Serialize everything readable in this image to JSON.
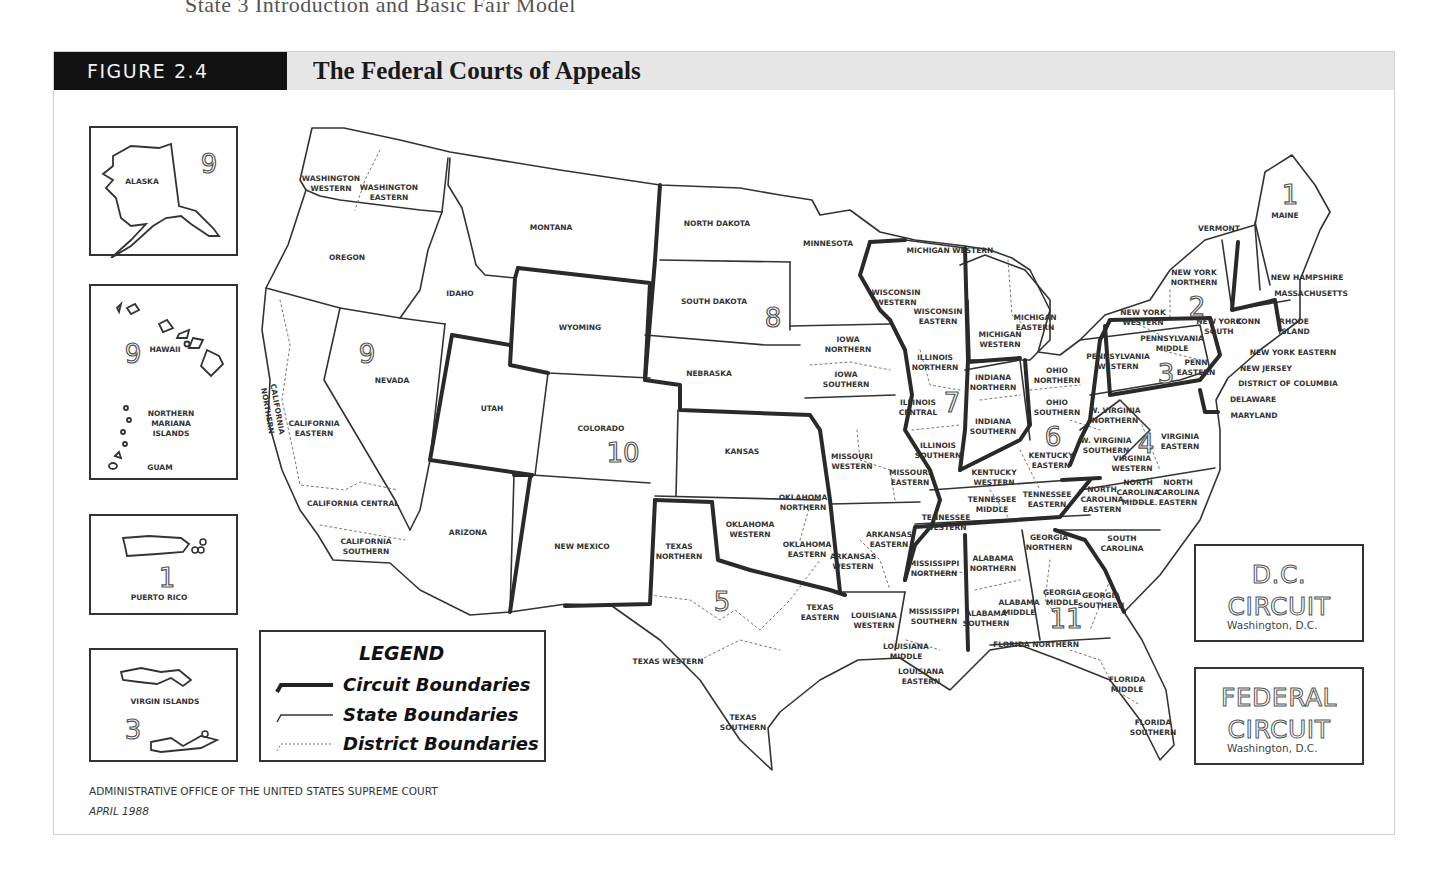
{
  "page_header": "State 3    Introduction and Basic Fair Model",
  "figure": {
    "label": "FIGURE 2.4",
    "title": "The Federal Courts of Appeals",
    "colors": {
      "label_bg": "#111111",
      "header_bg": "#e6e6e6",
      "line": "#333333"
    }
  },
  "insets": {
    "alaska": {
      "label": "ALASKA",
      "circuit": "9"
    },
    "hawaii": {
      "label": "HAWAII",
      "circuit": "9",
      "mariana": "NORTHERN\nMARIANA\nISLANDS",
      "guam": "GUAM"
    },
    "puerto_rico": {
      "label": "PUERTO RICO",
      "circuit": "1"
    },
    "virgin_islands": {
      "label": "VIRGIN ISLANDS",
      "circuit": "3"
    }
  },
  "legend": {
    "title": "LEGEND",
    "items": [
      {
        "style": "circuit",
        "label": "Circuit Boundaries"
      },
      {
        "style": "state",
        "label": "State Boundaries"
      },
      {
        "style": "district",
        "label": "District Boundaries"
      }
    ]
  },
  "special_circuits": [
    {
      "line1": "D.C.",
      "line2": "CIRCUIT",
      "location": "Washington, D.C."
    },
    {
      "line1": "FEDERAL",
      "line2": "CIRCUIT",
      "location": "Washington, D.C."
    }
  ],
  "credit": {
    "source": "ADMINISTRATIVE OFFICE OF THE UNITED STATES SUPREME COURT",
    "date": "APRIL 1988"
  },
  "circuit_numbers": [
    {
      "n": "1",
      "x": 1290,
      "y": 195
    },
    {
      "n": "2",
      "x": 1197,
      "y": 307
    },
    {
      "n": "3",
      "x": 1166,
      "y": 374
    },
    {
      "n": "4",
      "x": 1146,
      "y": 444
    },
    {
      "n": "5",
      "x": 722,
      "y": 602
    },
    {
      "n": "6",
      "x": 1053,
      "y": 437
    },
    {
      "n": "7",
      "x": 952,
      "y": 403
    },
    {
      "n": "8",
      "x": 773,
      "y": 318
    },
    {
      "n": "9",
      "x": 367,
      "y": 354
    },
    {
      "n": "10",
      "x": 623,
      "y": 453
    },
    {
      "n": "11",
      "x": 1066,
      "y": 619
    }
  ],
  "districts": [
    {
      "t": "WASHINGTON\nWESTERN",
      "x": 331,
      "y": 184
    },
    {
      "t": "WASHINGTON\nEASTERN",
      "x": 389,
      "y": 193
    },
    {
      "t": "OREGON",
      "x": 347,
      "y": 258
    },
    {
      "t": "MONTANA",
      "x": 551,
      "y": 228
    },
    {
      "t": "IDAHO",
      "x": 460,
      "y": 294
    },
    {
      "t": "WYOMING",
      "x": 580,
      "y": 328
    },
    {
      "t": "NEVADA",
      "x": 392,
      "y": 381
    },
    {
      "t": "CALIFORNIA\nNORTHERN",
      "x": 272,
      "y": 410,
      "rot": 80
    },
    {
      "t": "CALIFORNIA\nEASTERN",
      "x": 314,
      "y": 429
    },
    {
      "t": "CALIFORNIA CENTRAL",
      "x": 353,
      "y": 504
    },
    {
      "t": "CALIFORNIA\nSOUTHERN",
      "x": 366,
      "y": 547
    },
    {
      "t": "UTAH",
      "x": 492,
      "y": 409
    },
    {
      "t": "COLORADO",
      "x": 601,
      "y": 429
    },
    {
      "t": "ARIZONA",
      "x": 468,
      "y": 533
    },
    {
      "t": "NEW MEXICO",
      "x": 582,
      "y": 547
    },
    {
      "t": "NORTH DAKOTA",
      "x": 717,
      "y": 224
    },
    {
      "t": "SOUTH DAKOTA",
      "x": 714,
      "y": 302
    },
    {
      "t": "NEBRASKA",
      "x": 709,
      "y": 374
    },
    {
      "t": "KANSAS",
      "x": 742,
      "y": 452
    },
    {
      "t": "MINNESOTA",
      "x": 828,
      "y": 244
    },
    {
      "t": "IOWA\nNORTHERN",
      "x": 848,
      "y": 345
    },
    {
      "t": "IOWA\nSOUTHERN",
      "x": 846,
      "y": 380
    },
    {
      "t": "MISSOURI\nWESTERN",
      "x": 852,
      "y": 462
    },
    {
      "t": "MISSOURI\nEASTERN",
      "x": 910,
      "y": 478
    },
    {
      "t": "OKLAHOMA\nNORTHERN",
      "x": 803,
      "y": 503
    },
    {
      "t": "OKLAHOMA\nWESTERN",
      "x": 750,
      "y": 530
    },
    {
      "t": "OKLAHOMA\nEASTERN",
      "x": 807,
      "y": 550
    },
    {
      "t": "TEXAS\nNORTHERN",
      "x": 679,
      "y": 552
    },
    {
      "t": "TEXAS\nEASTERN",
      "x": 820,
      "y": 613
    },
    {
      "t": "TEXAS WESTERN",
      "x": 668,
      "y": 662
    },
    {
      "t": "TEXAS\nSOUTHERN",
      "x": 743,
      "y": 723
    },
    {
      "t": "ARKANSAS\nEASTERN",
      "x": 889,
      "y": 540
    },
    {
      "t": "ARKANSAS\nWESTERN",
      "x": 853,
      "y": 562
    },
    {
      "t": "LOUISIANA\nWESTERN",
      "x": 874,
      "y": 621
    },
    {
      "t": "LOUISIANA\nMIDDLE",
      "x": 906,
      "y": 652
    },
    {
      "t": "LOUISIANA\nEASTERN",
      "x": 921,
      "y": 677
    },
    {
      "t": "WISCONSIN\nWESTERN",
      "x": 896,
      "y": 298
    },
    {
      "t": "WISCONSIN\nEASTERN",
      "x": 938,
      "y": 317
    },
    {
      "t": "MICHIGAN WESTERN",
      "x": 950,
      "y": 251
    },
    {
      "t": "MICHIGAN\nEASTERN",
      "x": 1035,
      "y": 323
    },
    {
      "t": "MICHIGAN\nWESTERN",
      "x": 1000,
      "y": 340
    },
    {
      "t": "ILLINOIS\nNORTHERN",
      "x": 935,
      "y": 363
    },
    {
      "t": "ILLINOIS\nCENTRAL",
      "x": 918,
      "y": 408
    },
    {
      "t": "ILLINOIS\nSOUTHERN",
      "x": 938,
      "y": 451
    },
    {
      "t": "INDIANA\nNORTHERN",
      "x": 993,
      "y": 383
    },
    {
      "t": "INDIANA\nSOUTHERN",
      "x": 993,
      "y": 427
    },
    {
      "t": "OHIO\nNORTHERN",
      "x": 1057,
      "y": 376
    },
    {
      "t": "OHIO\nSOUTHERN",
      "x": 1057,
      "y": 408
    },
    {
      "t": "KENTUCKY\nEASTERN",
      "x": 1051,
      "y": 461
    },
    {
      "t": "KENTUCKY\nWESTERN",
      "x": 994,
      "y": 478
    },
    {
      "t": "TENNESSEE\nWESTERN",
      "x": 946,
      "y": 523
    },
    {
      "t": "TENNESSEE\nMIDDLE",
      "x": 992,
      "y": 505
    },
    {
      "t": "TENNESSEE\nEASTERN",
      "x": 1047,
      "y": 500
    },
    {
      "t": "MISSISSIPPI\nNORTHERN",
      "x": 934,
      "y": 569
    },
    {
      "t": "MISSISSIPPI\nSOUTHERN",
      "x": 934,
      "y": 617
    },
    {
      "t": "ALABAMA\nNORTHERN",
      "x": 993,
      "y": 564
    },
    {
      "t": "ALABAMA\nMIDDLE",
      "x": 1019,
      "y": 608
    },
    {
      "t": "ALABAMA\nSOUTHERN",
      "x": 986,
      "y": 619
    },
    {
      "t": "GEORGIA\nNORTHERN",
      "x": 1049,
      "y": 543
    },
    {
      "t": "GEORGIA\nMIDDLE",
      "x": 1062,
      "y": 598
    },
    {
      "t": "GEORGIA\nSOUTHERN",
      "x": 1101,
      "y": 601
    },
    {
      "t": "FLORIDA NORTHERN",
      "x": 1036,
      "y": 645
    },
    {
      "t": "FLORIDA\nMIDDLE",
      "x": 1127,
      "y": 685
    },
    {
      "t": "FLORIDA\nSOUTHERN",
      "x": 1153,
      "y": 728
    },
    {
      "t": "SOUTH\nCAROLINA",
      "x": 1122,
      "y": 544
    },
    {
      "t": "NORTH\nCAROLINA\nEASTERN",
      "x": 1102,
      "y": 500
    },
    {
      "t": "NORTH\nCAROLINA\nMIDDLE",
      "x": 1138,
      "y": 493
    },
    {
      "t": "NORTH\nCAROLINA\nEASTERN",
      "x": 1178,
      "y": 493
    },
    {
      "t": "VIRGINIA\nWESTERN",
      "x": 1132,
      "y": 464
    },
    {
      "t": "VIRGINIA\nEASTERN",
      "x": 1180,
      "y": 442
    },
    {
      "t": "W. VIRGINIA\nNORTHERN",
      "x": 1115,
      "y": 416
    },
    {
      "t": "W. VIRGINIA\nSOUTHERN",
      "x": 1106,
      "y": 446
    },
    {
      "t": "PENNSYLVANIA\nWESTERN",
      "x": 1118,
      "y": 362
    },
    {
      "t": "PENNSYLVANIA\nMIDDLE",
      "x": 1172,
      "y": 344
    },
    {
      "t": "PENN\nEASTERN",
      "x": 1196,
      "y": 368
    },
    {
      "t": "NEW YORK\nWESTERN",
      "x": 1143,
      "y": 318
    },
    {
      "t": "NEW YORK\nNORTHERN",
      "x": 1194,
      "y": 278
    },
    {
      "t": "NEW YORK\nSOUTH",
      "x": 1219,
      "y": 327
    },
    {
      "t": "CONN",
      "x": 1248,
      "y": 322
    },
    {
      "t": "VERMONT",
      "x": 1219,
      "y": 229
    },
    {
      "t": "MAINE",
      "x": 1285,
      "y": 216
    }
  ],
  "callouts": [
    {
      "t": "NEW HAMPSHIRE",
      "x": 1307,
      "y": 278
    },
    {
      "t": "MASSACHUSETTS",
      "x": 1311,
      "y": 294
    },
    {
      "t": "RHODE\nISLAND",
      "x": 1294,
      "y": 327
    },
    {
      "t": "NEW YORK EASTERN",
      "x": 1293,
      "y": 353
    },
    {
      "t": "NEW JERSEY",
      "x": 1266,
      "y": 369
    },
    {
      "t": "DISTRICT OF COLUMBIA",
      "x": 1288,
      "y": 384
    },
    {
      "t": "DELAWARE",
      "x": 1253,
      "y": 400
    },
    {
      "t": "MARYLAND",
      "x": 1254,
      "y": 416
    }
  ]
}
